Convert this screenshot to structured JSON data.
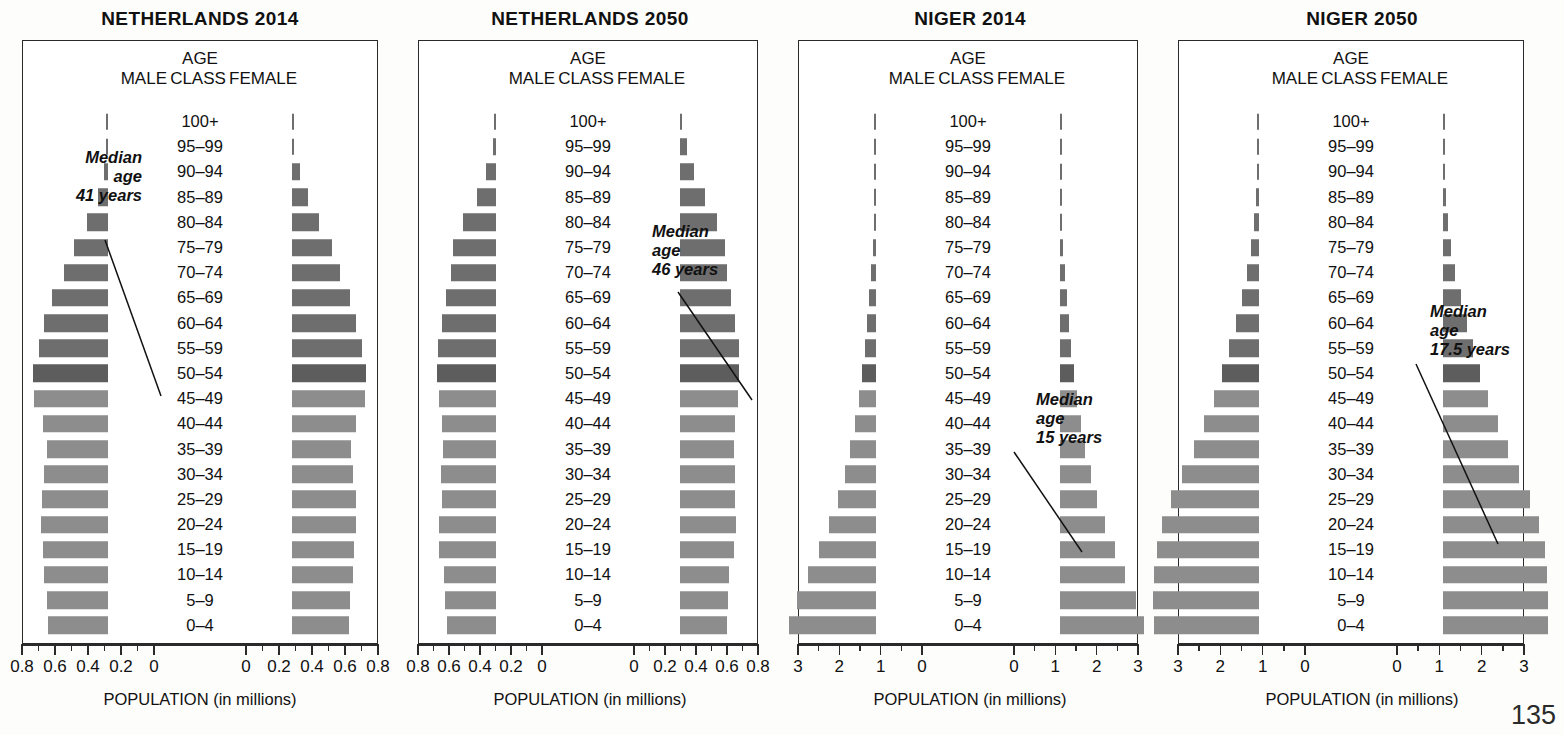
{
  "figure": {
    "page_number": "135",
    "axis_title": "POPULATION (in millions)",
    "header": {
      "age": "AGE",
      "male": "MALE",
      "class": "CLASS",
      "female": "FEMALE"
    },
    "colors": {
      "bar_light": "#8d8d8d",
      "bar_dark": "#6e6e6e",
      "bar_darker": "#5d5d5d",
      "frame": "#2a2a2a",
      "background": "#fdfdfb"
    },
    "age_classes": [
      "100+",
      "95–99",
      "90–94",
      "85–89",
      "80–84",
      "75–79",
      "70–74",
      "65–69",
      "60–64",
      "55–59",
      "50–54",
      "45–49",
      "40–44",
      "35–39",
      "30–34",
      "25–29",
      "20–24",
      "15–19",
      "10–14",
      "5–9",
      "0–4"
    ]
  },
  "panels": [
    {
      "title": "NETHERLANDS 2014",
      "annotation": {
        "line1": "Median",
        "line2": "age",
        "line3": "41 years"
      },
      "axis": {
        "max": 0.8,
        "major_ticks": [
          0.8,
          0.6,
          0.4,
          0.2,
          0
        ],
        "labels_left": [
          "0.8",
          "0.6",
          "0.4",
          "0.2",
          "0"
        ],
        "labels_right": [
          "0",
          "0.2",
          "0.4",
          "0.6",
          "0.8"
        ]
      }
    },
    {
      "title": "NETHERLANDS 2050",
      "annotation": {
        "line1": "Median",
        "line2": "age",
        "line3": "46 years"
      },
      "axis": {
        "max": 0.8,
        "major_ticks": [
          0.8,
          0.6,
          0.4,
          0.2,
          0
        ],
        "labels_left": [
          "0.8",
          "0.6",
          "0.4",
          "0.2",
          "0"
        ],
        "labels_right": [
          "0",
          "0.2",
          "0.4",
          "0.6",
          "0.8"
        ]
      }
    },
    {
      "title": "NIGER 2014",
      "annotation": {
        "line1": "Median",
        "line2": "age",
        "line3": "15 years"
      },
      "axis": {
        "max": 3,
        "major_ticks": [
          3,
          2,
          1,
          0
        ],
        "labels_left": [
          "3",
          "2",
          "1",
          "0"
        ],
        "labels_right": [
          "0",
          "1",
          "2",
          "3"
        ]
      }
    },
    {
      "title": "NIGER 2050",
      "annotation": {
        "line1": "Median",
        "line2": "age",
        "line3": "17.5 years"
      },
      "axis": {
        "max": 3,
        "major_ticks": [
          3,
          2,
          1,
          0
        ],
        "labels_left": [
          "3",
          "2",
          "1",
          "0"
        ],
        "labels_right": [
          "0",
          "1",
          "2",
          "3"
        ]
      }
    }
  ],
  "chart_data": {
    "type": "bar",
    "subtype": "population-pyramid",
    "xlabel": "POPULATION (in millions)",
    "ylabel": "AGE CLASS",
    "grid": false,
    "legend": "none",
    "units": "millions of people",
    "categories": [
      "100+",
      "95–99",
      "90–94",
      "85–89",
      "80–84",
      "75–79",
      "70–74",
      "65–69",
      "60–64",
      "55–59",
      "50–54",
      "45–49",
      "40–44",
      "35–39",
      "30–34",
      "25–29",
      "20–24",
      "15–19",
      "10–14",
      "5–9",
      "0–4"
    ],
    "charts": [
      {
        "name": "NETHERLANDS 2014",
        "xlim": [
          0,
          0.8
        ],
        "median_age_years": 41,
        "series": [
          {
            "name": "MALE",
            "side": "left",
            "values": [
              0.002,
              0.008,
              0.026,
              0.062,
              0.125,
              0.205,
              0.265,
              0.34,
              0.385,
              0.42,
              0.455,
              0.45,
              0.395,
              0.37,
              0.385,
              0.4,
              0.405,
              0.395,
              0.39,
              0.37,
              0.365
            ]
          },
          {
            "name": "FEMALE",
            "side": "right",
            "values": [
              0.004,
              0.014,
              0.046,
              0.098,
              0.165,
              0.24,
              0.288,
              0.352,
              0.39,
              0.425,
              0.45,
              0.44,
              0.385,
              0.358,
              0.37,
              0.385,
              0.388,
              0.378,
              0.372,
              0.352,
              0.348
            ]
          }
        ]
      },
      {
        "name": "NETHERLANDS 2050",
        "xlim": [
          0,
          0.8
        ],
        "median_age_years": 46,
        "series": [
          {
            "name": "MALE",
            "side": "left",
            "values": [
              0.004,
              0.02,
              0.062,
              0.125,
              0.21,
              0.275,
              0.29,
              0.32,
              0.35,
              0.375,
              0.38,
              0.37,
              0.35,
              0.345,
              0.355,
              0.35,
              0.365,
              0.37,
              0.335,
              0.33,
              0.318
            ]
          },
          {
            "name": "FEMALE",
            "side": "right",
            "values": [
              0.012,
              0.042,
              0.09,
              0.16,
              0.24,
              0.292,
              0.3,
              0.33,
              0.358,
              0.378,
              0.38,
              0.372,
              0.352,
              0.348,
              0.355,
              0.352,
              0.362,
              0.35,
              0.318,
              0.312,
              0.302
            ]
          }
        ]
      },
      {
        "name": "NIGER 2014",
        "xlim": [
          0,
          3
        ],
        "median_age_years": 15,
        "series": [
          {
            "name": "MALE",
            "side": "left",
            "values": [
              0.002,
              0.006,
              0.014,
              0.028,
              0.05,
              0.08,
              0.115,
              0.16,
              0.215,
              0.275,
              0.34,
              0.42,
              0.51,
              0.625,
              0.76,
              0.93,
              1.13,
              1.38,
              1.64,
              1.9,
              2.1
            ]
          },
          {
            "name": "FEMALE",
            "side": "right",
            "values": [
              0.002,
              0.006,
              0.015,
              0.03,
              0.052,
              0.082,
              0.118,
              0.162,
              0.218,
              0.278,
              0.342,
              0.42,
              0.505,
              0.615,
              0.745,
              0.905,
              1.095,
              1.33,
              1.58,
              1.83,
              2.04
            ]
          }
        ]
      },
      {
        "name": "NIGER 2050",
        "xlim": [
          0,
          3
        ],
        "median_age_years": 17.5,
        "series": [
          {
            "name": "MALE",
            "side": "left",
            "values": [
              0.004,
              0.012,
              0.03,
              0.062,
              0.112,
              0.185,
              0.28,
              0.4,
              0.545,
              0.7,
              0.87,
              1.06,
              1.29,
              1.54,
              1.81,
              2.08,
              2.28,
              2.42,
              2.48,
              2.5,
              2.49
            ]
          },
          {
            "name": "FEMALE",
            "side": "right",
            "values": [
              0.005,
              0.014,
              0.034,
              0.068,
              0.12,
              0.195,
              0.292,
              0.415,
              0.56,
              0.715,
              0.885,
              1.07,
              1.295,
              1.54,
              1.8,
              2.06,
              2.26,
              2.4,
              2.46,
              2.48,
              2.47
            ]
          }
        ]
      }
    ]
  }
}
